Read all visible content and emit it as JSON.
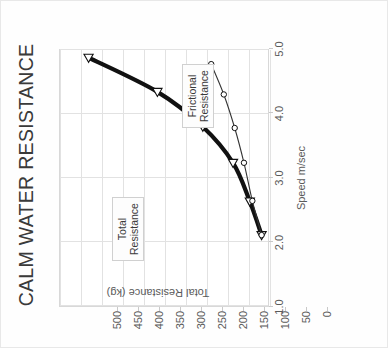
{
  "figure": {
    "title": "CALM WATER RESISTANCE",
    "orientation": "rotated-90-ccw"
  },
  "annotations": {
    "total": "Total\nResistance",
    "frictional": "Frictional\nResistance"
  },
  "axes": {
    "x_label": "Speed m/sec",
    "y_label": "Total Resistance (kg)",
    "x_ticks": [
      "1.0",
      "2.0",
      "3.0",
      "4.0",
      "5.0"
    ],
    "y_ticks": [
      "0",
      "50",
      "100",
      "150",
      "200",
      "250",
      "300",
      "350",
      "400",
      "450",
      "500"
    ]
  },
  "chart_data": {
    "type": "line",
    "title": "CALM WATER RESISTANCE",
    "xlabel": "Speed m/sec",
    "ylabel": "Total Resistance (kg)",
    "xlim": [
      1.0,
      5.0
    ],
    "ylim": [
      0,
      500
    ],
    "grid": true,
    "legend": "inline-annotations",
    "series": [
      {
        "name": "Total Resistance",
        "marker": "triangle",
        "style": "thick-black",
        "color": "#111111",
        "points": [
          {
            "x": 2.1,
            "y": 20
          },
          {
            "x": 2.62,
            "y": 48
          },
          {
            "x": 3.22,
            "y": 88
          },
          {
            "x": 3.78,
            "y": 160
          },
          {
            "x": 4.32,
            "y": 268
          },
          {
            "x": 4.85,
            "y": 432
          }
        ]
      },
      {
        "name": "Frictional Resistance",
        "marker": "circle",
        "style": "thin-black",
        "color": "#333333",
        "points": [
          {
            "x": 2.1,
            "y": 20
          },
          {
            "x": 2.63,
            "y": 42
          },
          {
            "x": 3.22,
            "y": 62
          },
          {
            "x": 3.76,
            "y": 84
          },
          {
            "x": 4.28,
            "y": 110
          },
          {
            "x": 4.75,
            "y": 140
          }
        ]
      }
    ]
  }
}
